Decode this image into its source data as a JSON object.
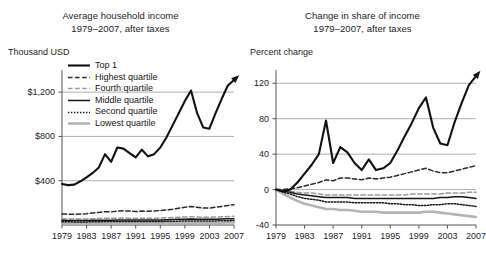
{
  "figure": {
    "background": "#ffffff",
    "panels": [
      "left",
      "right"
    ]
  },
  "left": {
    "title_line1": "Average household income",
    "title_line2": "1979–2007, after taxes",
    "axis_unit": "Thousand USD",
    "legend": {
      "items": [
        {
          "label": "Top 1",
          "style": "solid",
          "color": "#111111",
          "width": 2.1
        },
        {
          "label": "Highest quartile",
          "style": "dashed",
          "color": "#2b2b2b",
          "width": 1.5
        },
        {
          "label": "Fourth quartile",
          "style": "dashed",
          "color": "#9a9a9a",
          "width": 1.5
        },
        {
          "label": "Middle quartile",
          "style": "solid",
          "color": "#151515",
          "width": 1.5
        },
        {
          "label": "Second quartile",
          "style": "dotted",
          "color": "#151515",
          "width": 1.5
        },
        {
          "label": "Lowest quartile",
          "style": "solid",
          "color": "#b4b4b4",
          "width": 2.6
        }
      ]
    }
  },
  "right": {
    "title_line1": "Change in share of income",
    "title_line2": "1979–2007, after taxes",
    "axis_unit": "Percent change"
  },
  "chart_data": [
    {
      "type": "line",
      "panel": "left",
      "title": "Average household income 1979–2007, after taxes",
      "xlabel": "",
      "ylabel": "Thousand USD",
      "ylim": [
        0,
        1400
      ],
      "yticks": [
        400,
        800,
        1200
      ],
      "ytick_labels": [
        "$400",
        "$800",
        "$1,200"
      ],
      "xlim": [
        1979,
        2007
      ],
      "xticks": [
        1979,
        1983,
        1987,
        1991,
        1995,
        1999,
        2003,
        2007
      ],
      "xtick_labels": [
        "1979",
        "1983",
        "1987",
        "1991",
        "1995",
        "1999",
        "2003",
        "2007"
      ],
      "grid": "horizontal",
      "legend_position": "upper-left",
      "end_arrow": true,
      "x": [
        1979,
        1980,
        1981,
        1982,
        1983,
        1984,
        1985,
        1986,
        1987,
        1988,
        1989,
        1990,
        1991,
        1992,
        1993,
        1994,
        1995,
        1996,
        1997,
        1998,
        1999,
        2000,
        2001,
        2002,
        2003,
        2004,
        2005,
        2006,
        2007
      ],
      "series": [
        {
          "name": "Top 1",
          "style": "solid",
          "color": "#111111",
          "width": 2.1,
          "values": [
            370,
            360,
            365,
            395,
            430,
            470,
            520,
            640,
            570,
            700,
            690,
            650,
            610,
            680,
            620,
            640,
            700,
            790,
            900,
            1010,
            1120,
            1215,
            1010,
            880,
            870,
            1010,
            1140,
            1260,
            1310
          ]
        },
        {
          "name": "Highest quartile",
          "style": "dashed",
          "color": "#2b2b2b",
          "width": 1.5,
          "values": [
            100,
            98,
            97,
            99,
            102,
            108,
            113,
            120,
            118,
            127,
            128,
            126,
            122,
            126,
            124,
            127,
            131,
            136,
            143,
            152,
            160,
            168,
            160,
            153,
            153,
            161,
            168,
            176,
            183
          ]
        },
        {
          "name": "Fourth quartile",
          "style": "dashed",
          "color": "#9a9a9a",
          "width": 1.5,
          "values": [
            56,
            55,
            54,
            54,
            55,
            57,
            58,
            60,
            60,
            62,
            63,
            62,
            61,
            62,
            61,
            62,
            63,
            65,
            67,
            70,
            72,
            74,
            72,
            70,
            70,
            72,
            74,
            76,
            78
          ]
        },
        {
          "name": "Middle quartile",
          "style": "solid",
          "color": "#151515",
          "width": 1.5,
          "values": [
            42,
            41,
            40,
            40,
            41,
            42,
            43,
            44,
            44,
            46,
            46,
            46,
            45,
            45,
            45,
            46,
            46,
            48,
            49,
            51,
            53,
            54,
            53,
            52,
            52,
            53,
            54,
            56,
            57
          ]
        },
        {
          "name": "Second quartile",
          "style": "dotted",
          "color": "#151515",
          "width": 1.5,
          "values": [
            30,
            29,
            28,
            28,
            28,
            29,
            30,
            31,
            31,
            32,
            32,
            32,
            31,
            31,
            31,
            32,
            32,
            33,
            34,
            35,
            36,
            37,
            37,
            36,
            36,
            37,
            38,
            39,
            40
          ]
        },
        {
          "name": "Lowest quartile",
          "style": "solid",
          "color": "#b4b4b4",
          "width": 2.6,
          "values": [
            16,
            15,
            15,
            15,
            15,
            16,
            16,
            17,
            17,
            17,
            18,
            17,
            17,
            17,
            17,
            17,
            18,
            18,
            19,
            20,
            20,
            21,
            21,
            20,
            20,
            21,
            21,
            22,
            22
          ]
        }
      ]
    },
    {
      "type": "line",
      "panel": "right",
      "title": "Change in share of income 1979–2007, after taxes",
      "xlabel": "",
      "ylabel": "Percent change",
      "ylim": [
        -40,
        135
      ],
      "yticks": [
        -40,
        0,
        40,
        80,
        120
      ],
      "ytick_labels": [
        "-40",
        "0",
        "40",
        "80",
        "120"
      ],
      "xlim": [
        1979,
        2007
      ],
      "xticks": [
        1979,
        1983,
        1987,
        1991,
        1995,
        1999,
        2003,
        2007
      ],
      "xtick_labels": [
        "1979",
        "1983",
        "1987",
        "1991",
        "1995",
        "1999",
        "2003",
        "2007"
      ],
      "grid": "horizontal",
      "end_arrow": true,
      "x": [
        1979,
        1980,
        1981,
        1982,
        1983,
        1984,
        1985,
        1986,
        1987,
        1988,
        1989,
        1990,
        1991,
        1992,
        1993,
        1994,
        1995,
        1996,
        1997,
        1998,
        1999,
        2000,
        2001,
        2002,
        2003,
        2004,
        2005,
        2006,
        2007
      ],
      "series": [
        {
          "name": "Top 1",
          "style": "solid",
          "color": "#111111",
          "width": 2.1,
          "values": [
            0,
            -2,
            0,
            8,
            18,
            28,
            40,
            78,
            30,
            48,
            42,
            30,
            22,
            34,
            22,
            24,
            30,
            44,
            60,
            75,
            92,
            104,
            70,
            52,
            50,
            76,
            98,
            118,
            128
          ]
        },
        {
          "name": "Highest quartile",
          "style": "dashed",
          "color": "#2b2b2b",
          "width": 1.5,
          "values": [
            0,
            0,
            1,
            2,
            4,
            6,
            8,
            11,
            10,
            13,
            13,
            12,
            11,
            13,
            12,
            13,
            14,
            16,
            18,
            20,
            22,
            24,
            21,
            19,
            19,
            21,
            23,
            25,
            27
          ]
        },
        {
          "name": "Fourth quartile",
          "style": "dashed",
          "color": "#9a9a9a",
          "width": 1.5,
          "values": [
            0,
            -1,
            -2,
            -3,
            -4,
            -4,
            -5,
            -6,
            -6,
            -6,
            -6,
            -6,
            -6,
            -6,
            -6,
            -6,
            -6,
            -6,
            -6,
            -5,
            -5,
            -5,
            -5,
            -5,
            -4,
            -4,
            -4,
            -3,
            -3
          ]
        },
        {
          "name": "Middle quartile",
          "style": "solid",
          "color": "#151515",
          "width": 1.5,
          "values": [
            0,
            -2,
            -3,
            -5,
            -6,
            -7,
            -8,
            -9,
            -9,
            -9,
            -9,
            -10,
            -10,
            -10,
            -10,
            -10,
            -10,
            -10,
            -10,
            -10,
            -10,
            -10,
            -10,
            -9,
            -9,
            -8,
            -8,
            -9,
            -10
          ]
        },
        {
          "name": "Second quartile",
          "style": "dotted",
          "color": "#151515",
          "width": 1.5,
          "values": [
            0,
            -3,
            -5,
            -8,
            -10,
            -11,
            -12,
            -14,
            -14,
            -14,
            -14,
            -15,
            -15,
            -15,
            -15,
            -15,
            -16,
            -16,
            -17,
            -17,
            -18,
            -18,
            -17,
            -17,
            -16,
            -16,
            -17,
            -18,
            -19
          ]
        },
        {
          "name": "Lowest quartile",
          "style": "solid",
          "color": "#b4b4b4",
          "width": 2.6,
          "values": [
            0,
            -5,
            -9,
            -13,
            -16,
            -18,
            -20,
            -22,
            -22,
            -23,
            -23,
            -24,
            -25,
            -25,
            -25,
            -26,
            -26,
            -26,
            -26,
            -26,
            -26,
            -25,
            -25,
            -26,
            -27,
            -28,
            -29,
            -30,
            -31
          ]
        }
      ]
    }
  ]
}
